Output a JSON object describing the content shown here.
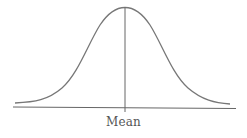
{
  "diagram": {
    "type": "normal-distribution-curve",
    "labels": {
      "mean": "Mean"
    },
    "colors": {
      "curve": "#777777",
      "axis": "#666666",
      "mean_line": "#666666",
      "label": "#555555",
      "background": "#ffffff"
    }
  }
}
